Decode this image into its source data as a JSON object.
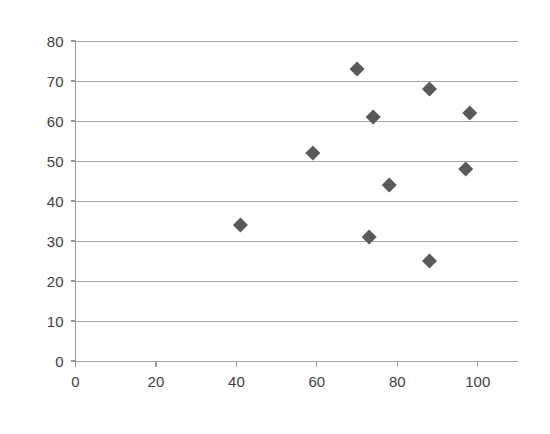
{
  "chart_data": {
    "type": "scatter",
    "title": "",
    "subtitle": "",
    "xlabel": "",
    "ylabel": "",
    "xlim": [
      0,
      110
    ],
    "ylim": [
      0,
      80
    ],
    "x_ticks": [
      0,
      20,
      40,
      60,
      80,
      100
    ],
    "y_ticks": [
      0,
      10,
      20,
      30,
      40,
      50,
      60,
      70,
      80
    ],
    "x_tick_labels": [
      "0",
      "20",
      "40",
      "60",
      "80",
      "100"
    ],
    "y_tick_labels": [
      "0",
      "10",
      "20",
      "30",
      "40",
      "50",
      "60",
      "70",
      "80"
    ],
    "grid": "horizontal",
    "legend": "none",
    "marker": "diamond",
    "marker_color": "#595959",
    "gridline_color": "#9a9a9a",
    "axis_color": "#9a9a9a",
    "tick_label_color": "#3f3f3f",
    "background_color": "#ffffff",
    "series": [
      {
        "name": "Series 1",
        "points": [
          {
            "x": 41,
            "y": 34
          },
          {
            "x": 59,
            "y": 52
          },
          {
            "x": 70,
            "y": 73
          },
          {
            "x": 73,
            "y": 31
          },
          {
            "x": 74,
            "y": 61
          },
          {
            "x": 78,
            "y": 44
          },
          {
            "x": 88,
            "y": 68
          },
          {
            "x": 88,
            "y": 25
          },
          {
            "x": 97,
            "y": 48
          },
          {
            "x": 98,
            "y": 62
          }
        ]
      }
    ]
  }
}
